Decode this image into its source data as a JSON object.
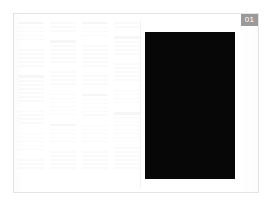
{
  "viewport": {
    "background_color": "#ffffff",
    "width": 276,
    "height": 214
  },
  "page": {
    "name": "document-page",
    "background_color": "#ffffff",
    "border_color": "#e3e3e3"
  },
  "badge": {
    "label": "01",
    "background_color": "#9a9a9a",
    "text_color": "#ffffff"
  },
  "image_block": {
    "name": "black-image-placeholder",
    "fill_color": "#070707",
    "alt_label": ""
  },
  "text_pane": {
    "description": "faint grey text columns",
    "line_color": "#fafafa",
    "heading_color": "#f6f6f6",
    "columns": [
      {
        "lines": [
          "hdr",
          "line",
          "line",
          "line",
          "line",
          "gap",
          "line",
          "line",
          "line",
          "line",
          "line",
          "gap",
          "hdr",
          "line",
          "line",
          "line",
          "line",
          "line",
          "line",
          "gap",
          "line",
          "line",
          "line",
          "line",
          "gap",
          "line",
          "line",
          "line",
          "line",
          "line",
          "gap",
          "line",
          "line",
          "line"
        ]
      },
      {
        "lines": [
          "line",
          "line",
          "line",
          "gap",
          "hdr",
          "line",
          "line",
          "line",
          "line",
          "line",
          "gap",
          "line",
          "line",
          "line",
          "line",
          "gap",
          "line",
          "line",
          "line",
          "line",
          "line",
          "line",
          "gap",
          "hdr",
          "line",
          "line",
          "line",
          "line",
          "gap",
          "line",
          "line",
          "line",
          "line",
          "line"
        ]
      },
      {
        "lines": [
          "hdr",
          "line",
          "line",
          "line",
          "gap",
          "line",
          "line",
          "line",
          "line",
          "line",
          "line",
          "gap",
          "line",
          "line",
          "line",
          "gap",
          "hdr",
          "line",
          "line",
          "line",
          "line",
          "line",
          "gap",
          "line",
          "line",
          "line",
          "line",
          "line",
          "gap",
          "line",
          "line",
          "line",
          "line",
          "line"
        ]
      },
      {
        "lines": [
          "line",
          "line",
          "gap",
          "hdr",
          "line",
          "line",
          "line",
          "line",
          "gap",
          "line",
          "line",
          "line",
          "line",
          "line",
          "gap",
          "line",
          "line",
          "line",
          "line",
          "gap",
          "hdr",
          "line",
          "line",
          "line",
          "line",
          "line",
          "line",
          "gap",
          "line",
          "line",
          "line",
          "line",
          "line",
          "line"
        ]
      }
    ]
  }
}
